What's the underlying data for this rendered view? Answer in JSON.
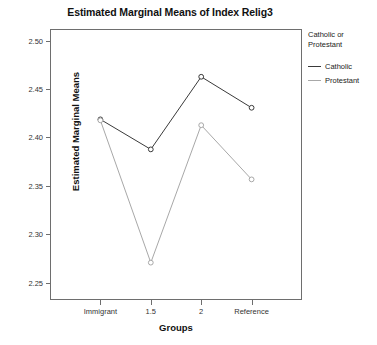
{
  "chart_data": {
    "type": "line",
    "title": "Estimated Marginal Means of Index Relig3",
    "xlabel": "Groups",
    "ylabel": "Estimated Marginal Means",
    "categories": [
      "Immigrant",
      "1.5",
      "2",
      "Reference"
    ],
    "yticks": [
      "2.25",
      "2.30",
      "2.35",
      "2.40",
      "2.45",
      "2.50"
    ],
    "ylim": [
      2.25,
      2.5
    ],
    "grid": false,
    "legend_position": "right",
    "legend_title": "Catholic or Protestant",
    "series": [
      {
        "name": "Catholic",
        "color": "#3a3a3a",
        "marker": "circle",
        "values": [
          2.418,
          2.387,
          2.462,
          2.43
        ]
      },
      {
        "name": "Protestant",
        "color": "#a8a8a8",
        "marker": "circle",
        "values": [
          2.417,
          2.27,
          2.412,
          2.356
        ]
      }
    ]
  },
  "legend": {
    "title_line1": "Catholic or",
    "title_line2": "Protestant",
    "items": [
      {
        "label": "Catholic"
      },
      {
        "label": "Protestant"
      }
    ]
  }
}
